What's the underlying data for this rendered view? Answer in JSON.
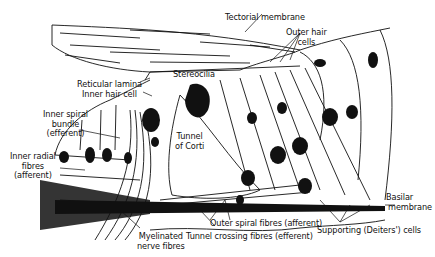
{
  "diagram": {
    "labels": {
      "tectorial_membrane": "Tectorial membrane",
      "outer_hair_cells": [
        "Outer hair",
        "cells"
      ],
      "stereocilia": "Stereocilia",
      "reticular_lamina": "Reticular lamina",
      "inner_hair_cell": "Inner hair cell",
      "inner_spiral_bundle": [
        "Inner spiral",
        "bundle",
        "(efferent)"
      ],
      "inner_radial_fibres": [
        "Inner radial",
        "fibres",
        "(afferent)"
      ],
      "tunnel_of_corti": [
        "Tunnel",
        "of Corti"
      ],
      "basilar_membrane": [
        "Basilar",
        "membrane"
      ],
      "outer_spiral_fibres": "Outer spiral fibres (afferent)",
      "tunnel_crossing_fibres": "Tunnel crossing fibres (efferent)",
      "myelinated_nerve_fibres": [
        "Myelinated",
        "nerve fibres"
      ],
      "supporting_cells": "Supporting (Deiters') cells"
    },
    "colors": {
      "ink": "#111111",
      "background": "#ffffff"
    }
  }
}
